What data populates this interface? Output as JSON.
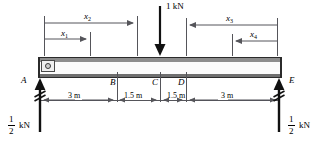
{
  "figure": {
    "type": "free-body-diagram",
    "beam": {
      "left_end_label": "A",
      "right_end_label": "E",
      "interior_labels": [
        "B",
        "C",
        "D"
      ]
    },
    "applied_load": {
      "label": "1 kN",
      "magnitude": 1,
      "unit": "kN",
      "direction": "down",
      "at_point": "C"
    },
    "reactions": [
      {
        "at_point": "A",
        "numerator": "1",
        "denominator": "2",
        "unit": "kN",
        "direction": "up"
      },
      {
        "at_point": "E",
        "numerator": "1",
        "denominator": "2",
        "unit": "kN",
        "direction": "up"
      }
    ],
    "span_dimensions": [
      {
        "label": "3 m",
        "value": 3,
        "unit": "m",
        "from": "A",
        "to": "B"
      },
      {
        "label": "1.5 m",
        "value": 1.5,
        "unit": "m",
        "from": "B",
        "to": "C"
      },
      {
        "label": "1.5 m",
        "value": 1.5,
        "unit": "m",
        "from": "C",
        "to": "D"
      },
      {
        "label": "3 m",
        "value": 3,
        "unit": "m",
        "from": "D",
        "to": "E"
      }
    ],
    "station_variables": [
      {
        "symbol": "x",
        "subscript": "1",
        "from": "A",
        "arrow": "right"
      },
      {
        "symbol": "x",
        "subscript": "2",
        "from": "A",
        "arrow": "right"
      },
      {
        "symbol": "x",
        "subscript": "3",
        "from": "E",
        "arrow": "left"
      },
      {
        "symbol": "x",
        "subscript": "4",
        "from": "E",
        "arrow": "left"
      }
    ],
    "colors": {
      "ink": "#000000",
      "rule": "#55555a",
      "beam_edge": "#2b2b2b",
      "beam_top": "#8d8d8d",
      "beam_bottom": "#6f6f6f",
      "beam_face": "#fbfbfb"
    }
  }
}
